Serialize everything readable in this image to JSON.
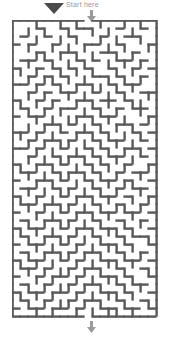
{
  "app": {
    "title": "Maze Puzzle",
    "background_color": "#ffffff"
  },
  "labels": {
    "start_text": "Start here"
  },
  "icons": {
    "cursor": "cursor-arrow-icon",
    "entrance": "down-arrow-icon",
    "exit": "down-arrow-icon",
    "corner": "corner-mark-icon"
  },
  "colors": {
    "wall": "#595959",
    "wall_light": "#8a8a8a",
    "background": "#ffffff",
    "label_text": "#9a9a9a",
    "cursor": "#4a4a4a",
    "arrow": "#9a9a9a"
  },
  "maze": {
    "columns": 18,
    "rows": 37,
    "cell_size": 8,
    "wall_thickness": 1.2,
    "origin_x": 12,
    "origin_y": 20,
    "width": 148,
    "height": 298,
    "entrance_column": 10,
    "exit_column": 10,
    "entrance_label": "top",
    "exit_label": "bottom",
    "h_walls": [
      "111111111011111111",
      "000100101100010010",
      "010010010001001100",
      "101001000110010001",
      "000100110001100100",
      "011010001010011010",
      "100101010100100101",
      "001010100011010010",
      "110101001100101100",
      "001010110010010011",
      "100101001101101000",
      "010010110010010110",
      "101100001101100001",
      "000011010010011010",
      "110100101101000101",
      "001011010010110010",
      "110100100101001101",
      "001001011010110010",
      "100110100101001001",
      "011001011010010110",
      "100110100101101001",
      "011001010010010110",
      "100100101101101001",
      "011011010010010010",
      "100100101101101101",
      "010011010010010010",
      "101100101101101001",
      "010011010010010110",
      "101100101001101001",
      "010011010110010010",
      "101100101001101101",
      "011010010110010010",
      "100101101001101001",
      "010010010110010110",
      "101101101001101001",
      "010010010110010010",
      "101101101001101101",
      "111111111011111111"
    ],
    "v_walls": [
      "1001001010010010101",
      "1010100100101001001",
      "1001001010010100101",
      "1010010101001010011",
      "1001101010100101001",
      "1010010101001010101",
      "1101001010100101001",
      "1010110101001010101",
      "1001001010110101001",
      "1010100101001010011",
      "1101010010101001101",
      "1010101001010100101",
      "1001010110101010011",
      "1010101001010101001",
      "1101010010101010101",
      "1010101101010101001",
      "1001010010101010101",
      "1010101101010101001",
      "1101010010101010011",
      "1010101101010100101",
      "1001010010101011001",
      "1010101101010100101",
      "1101010010101001011",
      "1010101101010110101",
      "1001010010101001001",
      "1010101101010010101",
      "1101010010101101001",
      "1010101101010010011",
      "1001010010101101001",
      "1010101101010010101",
      "1101010010101101001",
      "1010101101010010011",
      "1001010010101101001",
      "1010101101010010101",
      "1101010010101101001",
      "1010101101010010011",
      "1001010010101101001"
    ]
  }
}
